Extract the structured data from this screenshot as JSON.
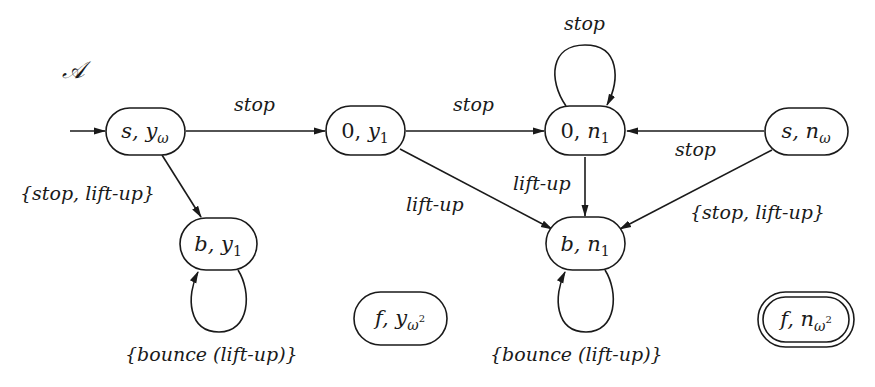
{
  "diagram": {
    "title": "𝒜",
    "states": [
      {
        "id": "s_yw",
        "left": "s, ",
        "var": "y",
        "sub": "ω",
        "sup": "",
        "initial": true,
        "accepting": false
      },
      {
        "id": "0_y1",
        "left": "0, ",
        "var": "y",
        "sub": "1",
        "sup": "",
        "initial": false,
        "accepting": false
      },
      {
        "id": "0_n1",
        "left": "0, ",
        "var": "n",
        "sub": "1",
        "sup": "",
        "initial": false,
        "accepting": false
      },
      {
        "id": "s_nw",
        "left": "s, ",
        "var": "n",
        "sub": "ω",
        "sup": "",
        "initial": false,
        "accepting": false
      },
      {
        "id": "b_y1",
        "left": "b, ",
        "var": "y",
        "sub": "1",
        "sup": "",
        "initial": false,
        "accepting": false
      },
      {
        "id": "b_n1",
        "left": "b, ",
        "var": "n",
        "sub": "1",
        "sup": "",
        "initial": false,
        "accepting": false
      },
      {
        "id": "f_yw2",
        "left": "f, ",
        "var": "y",
        "sub": "ω",
        "sup": "2",
        "initial": false,
        "accepting": false
      },
      {
        "id": "f_nw2",
        "left": "f, ",
        "var": "n",
        "sub": "ω",
        "sup": "2",
        "initial": false,
        "accepting": true
      }
    ],
    "transitions": [
      {
        "from": "s_yw",
        "to": "0_y1",
        "label": "stop"
      },
      {
        "from": "0_y1",
        "to": "0_n1",
        "label": "stop"
      },
      {
        "from": "0_n1",
        "to": "0_n1",
        "label": "stop"
      },
      {
        "from": "s_nw",
        "to": "0_n1",
        "label": "stop"
      },
      {
        "from": "s_yw",
        "to": "b_y1",
        "label": "{stop, lift-up}"
      },
      {
        "from": "0_y1",
        "to": "b_n1",
        "label": "lift-up"
      },
      {
        "from": "0_n1",
        "to": "b_n1",
        "label": "lift-up"
      },
      {
        "from": "s_nw",
        "to": "b_n1",
        "label": "{stop, lift-up}"
      },
      {
        "from": "b_y1",
        "to": "b_y1",
        "label": "{bounce (lift-up)}"
      },
      {
        "from": "b_n1",
        "to": "b_n1",
        "label": "{bounce (lift-up)}"
      }
    ]
  }
}
